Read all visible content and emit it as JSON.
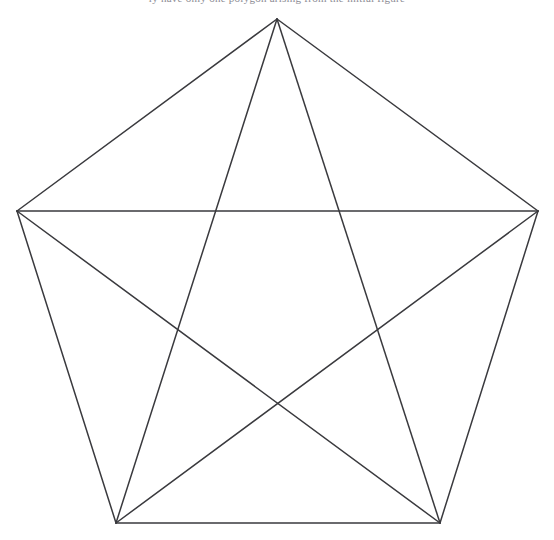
{
  "page": {
    "width": 554,
    "height": 540,
    "background_color": "#ffffff",
    "header_text_fragment": "ly have only one polygon arising from the initial figure"
  },
  "figure": {
    "name": "pentagon-with-all-diagonals",
    "line_color": "#3a3a3e",
    "line_width": 1.5,
    "fill": "none"
  },
  "chart_data": {
    "type": "diagram",
    "title": "",
    "subtitle": "",
    "xlabel": "",
    "ylabel": "",
    "grid": false,
    "legend": null,
    "graph": "K5",
    "vertex_count": 5,
    "edge_count": 10,
    "vertices": [
      {
        "id": "A",
        "label": "",
        "x": 277,
        "y": 19
      },
      {
        "id": "B",
        "label": "",
        "x": 538,
        "y": 211
      },
      {
        "id": "C",
        "label": "",
        "x": 440,
        "y": 523
      },
      {
        "id": "D",
        "label": "",
        "x": 116,
        "y": 523
      },
      {
        "id": "E",
        "label": "",
        "x": 17,
        "y": 211
      }
    ],
    "sides": [
      {
        "from": "A",
        "to": "B",
        "x1": 277,
        "y1": 19,
        "x2": 538,
        "y2": 211
      },
      {
        "from": "B",
        "to": "C",
        "x1": 538,
        "y1": 211,
        "x2": 440,
        "y2": 523
      },
      {
        "from": "C",
        "to": "D",
        "x1": 440,
        "y1": 523,
        "x2": 116,
        "y2": 523
      },
      {
        "from": "D",
        "to": "E",
        "x1": 116,
        "y1": 523,
        "x2": 17,
        "y2": 211
      },
      {
        "from": "E",
        "to": "A",
        "x1": 17,
        "y1": 211,
        "x2": 277,
        "y2": 19
      }
    ],
    "diagonals": [
      {
        "from": "A",
        "to": "C",
        "x1": 277,
        "y1": 19,
        "x2": 440,
        "y2": 523
      },
      {
        "from": "A",
        "to": "D",
        "x1": 277,
        "y1": 19,
        "x2": 116,
        "y2": 523
      },
      {
        "from": "B",
        "to": "D",
        "x1": 538,
        "y1": 211,
        "x2": 116,
        "y2": 523
      },
      {
        "from": "B",
        "to": "E",
        "x1": 538,
        "y1": 211,
        "x2": 17,
        "y2": 211
      },
      {
        "from": "C",
        "to": "E",
        "x1": 440,
        "y1": 523,
        "x2": 17,
        "y2": 211
      }
    ]
  }
}
